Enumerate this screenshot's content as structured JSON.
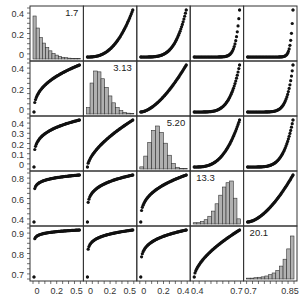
{
  "chart_data": {
    "type": "scatter-matrix",
    "title": "",
    "grid": {
      "rows": 5,
      "cols": 5
    },
    "diagonal": "histogram",
    "variables": [
      {
        "name": "V1",
        "label": "1.7",
        "range": [
          0,
          0.6
        ],
        "xticks": [
          "0",
          "0.2",
          "0.5"
        ],
        "yticks": [
          "0",
          "0.2",
          "0.4"
        ]
      },
      {
        "name": "V2",
        "label": "3.13",
        "range": [
          0,
          0.5
        ],
        "xticks": [
          "0",
          "0.2",
          "0.5"
        ],
        "yticks": [
          "0",
          "0.2",
          "0.4"
        ]
      },
      {
        "name": "V3",
        "label": "5.20",
        "range": [
          0,
          0.5
        ],
        "xticks": [
          "0",
          "0.2",
          "0.4"
        ],
        "yticks": [
          "0",
          "0.1",
          "0.2",
          "0.3",
          "0.4"
        ]
      },
      {
        "name": "V4",
        "label": "13.3",
        "range": [
          0.4,
          0.95
        ],
        "xticks": [
          "0.4",
          "0.7"
        ],
        "yticks": [
          "0.4",
          "0.6",
          "0.8"
        ]
      },
      {
        "name": "V5",
        "label": "20.1",
        "range": [
          0.7,
          1.0
        ],
        "xticks": [
          "0.7",
          "0.85"
        ],
        "yticks": [
          "0.7",
          "0.8",
          "0.9"
        ]
      }
    ],
    "histograms": [
      {
        "var": "V1",
        "values": [
          1.0,
          0.72,
          0.5,
          0.37,
          0.27,
          0.19,
          0.13,
          0.09,
          0.06,
          0.04,
          0.03,
          0.02,
          0.01,
          0.01,
          0.01
        ]
      },
      {
        "var": "V2",
        "values": [
          0.15,
          0.72,
          1.0,
          0.98,
          0.82,
          0.62,
          0.42,
          0.26,
          0.15,
          0.08,
          0.04,
          0.02,
          0.01
        ]
      },
      {
        "var": "V3",
        "values": [
          0.05,
          0.3,
          0.62,
          0.9,
          1.0,
          0.85,
          0.6,
          0.32,
          0.13,
          0.04,
          0.01,
          0.01
        ]
      },
      {
        "var": "V4",
        "values": [
          0.03,
          0.03,
          0.06,
          0.1,
          0.18,
          0.3,
          0.47,
          0.67,
          0.86,
          0.96,
          1.0,
          0.6,
          0.12
        ]
      },
      {
        "var": "V5",
        "values": [
          0.02,
          0.02,
          0.03,
          0.04,
          0.05,
          0.07,
          0.1,
          0.14,
          0.2,
          0.3,
          0.46,
          0.7,
          1.0
        ]
      }
    ],
    "off_diagonal": "monotone increasing scatter (rank-transformed curves)",
    "colors": {
      "points": "#111111",
      "bars": "#b0b0b0",
      "bar_edge": "#333333",
      "frame": "#333333"
    }
  }
}
